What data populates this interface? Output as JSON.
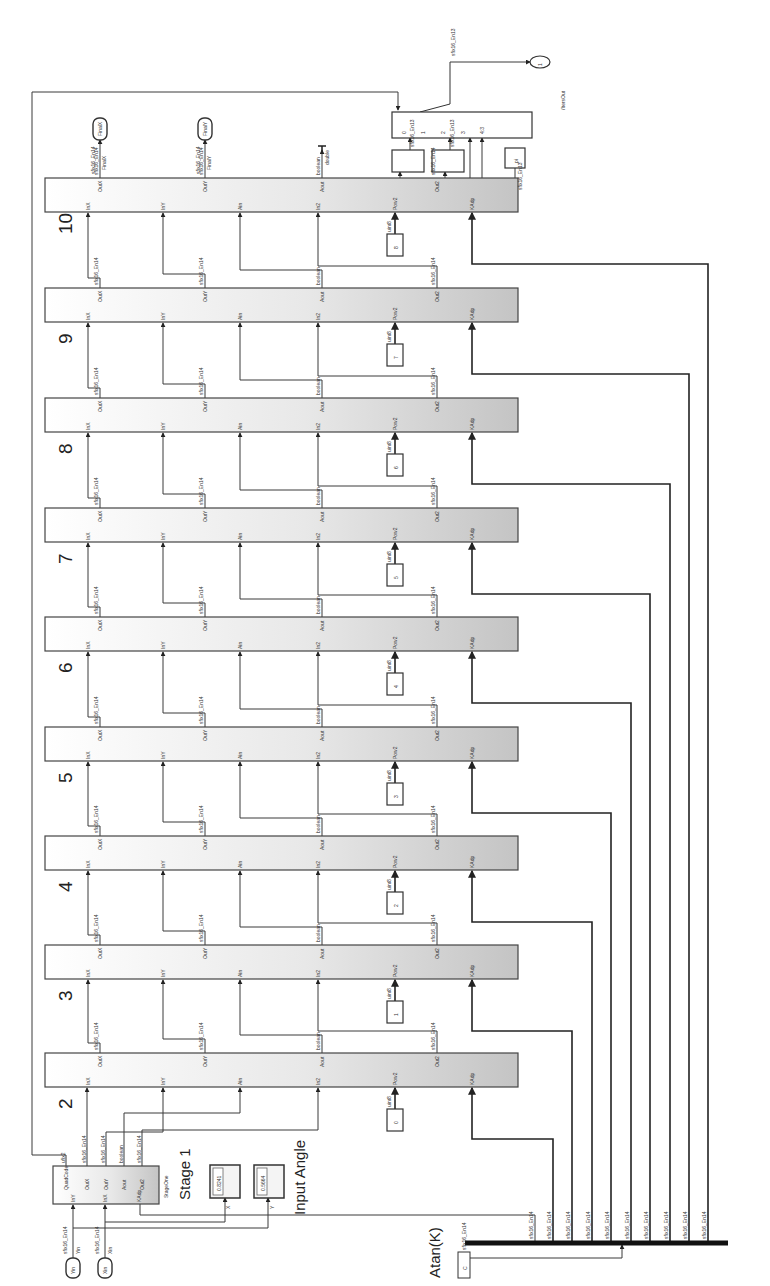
{
  "diagram": {
    "orientation": "rotated 90deg counter-clockwise",
    "colors": {
      "wire": "#3a3a3a",
      "block_fill_start": "#ffffff",
      "block_fill_end": "#c8c8c8",
      "bus": "#111111"
    }
  },
  "inputs": [
    {
      "id": "xin",
      "label": "Xin",
      "signal": "Xin",
      "type": "sfix16_En14"
    },
    {
      "id": "yin",
      "label": "Yin",
      "signal": "Yin",
      "type": "sfix16_En14"
    }
  ],
  "stage1": {
    "label": "Stage 1",
    "subtitle": "StageOne",
    "ports_in": [
      "InY",
      "InX",
      "KAdp"
    ],
    "ports_out": [
      "QuadCode",
      "OutX",
      "OutY",
      "Aout",
      "Out2"
    ],
    "port_types": [
      "ufix2",
      "sfix16_En14",
      "sfix16_En14",
      "boolean",
      "sfix16_En14"
    ]
  },
  "input_angle": {
    "label": "Input Angle",
    "displays": [
      {
        "name": "X",
        "value": "0.8241"
      },
      {
        "name": "Y",
        "value": "0.5664"
      }
    ]
  },
  "stages": [
    {
      "num": "2",
      "pow2": "0"
    },
    {
      "num": "3",
      "pow2": "1"
    },
    {
      "num": "4",
      "pow2": "2"
    },
    {
      "num": "5",
      "pow2": "3"
    },
    {
      "num": "6",
      "pow2": "4"
    },
    {
      "num": "7",
      "pow2": "5"
    },
    {
      "num": "8",
      "pow2": "6"
    },
    {
      "num": "9",
      "pow2": "7"
    },
    {
      "num": "10",
      "pow2": "8"
    }
  ],
  "stage_ports": {
    "inputs": [
      "InX",
      "InY",
      "Ain",
      "In2",
      "Pow2",
      "KAdp"
    ],
    "outputs": [
      "OutX",
      "OutY",
      "Aout",
      "Out2"
    ],
    "out_types": [
      "sfix16_En14",
      "sfix16_En14",
      "boolean",
      "sfix16_En14"
    ],
    "pow2_type": "uint8"
  },
  "outputs": [
    {
      "id": "finalx",
      "label": "FinalX",
      "signal": "FinalX",
      "type": "sfix16_En14"
    },
    {
      "id": "finaly",
      "label": "FinalY",
      "signal": "FinalY",
      "type": "sfix16_En14"
    }
  ],
  "terminator": {
    "label": "double"
  },
  "atan": {
    "label": "Atan(K)",
    "constant": "C",
    "type": "sfix16_En14",
    "bus_signals": [
      "sfix16_En14",
      "sfix16_En14",
      "sfix16_En14",
      "sfix16_En14",
      "sfix16_En14",
      "sfix16_En14",
      "sfix16_En14",
      "sfix16_En14",
      "sfix16_En14",
      "sfix16_En14"
    ]
  },
  "quadrant_switch": {
    "label": "/ItersOut",
    "pi_constant": "pi",
    "pi_type": "sfix16_En13",
    "switch_ports": [
      "0",
      "1",
      "2",
      "3",
      "4:3"
    ],
    "output_type": "sfix16_En13",
    "outport": "1",
    "gain_blocks": [
      "sfix16_En13",
      "sfix16_En13"
    ]
  }
}
